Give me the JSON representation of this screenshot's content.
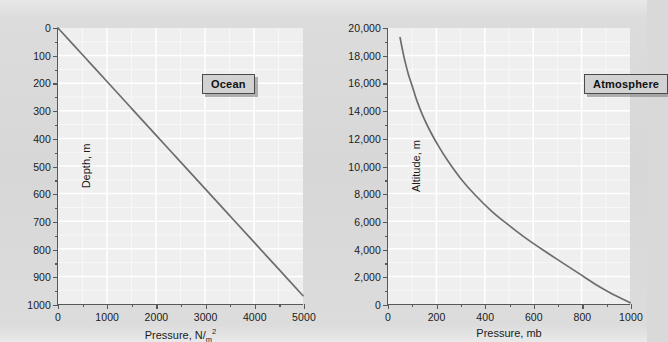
{
  "figure": {
    "background_color": "#d9d9d9",
    "plot_background_color": "#efefef",
    "gridline_color": "#ffffff",
    "axis_color": "#58585a",
    "curve_color": "#6d6d70"
  },
  "chart_data": [
    {
      "type": "line",
      "title": "Ocean",
      "xlabel": "Pressure, N/m²",
      "ylabel": "Depth, m",
      "xlim": [
        0,
        5000
      ],
      "ylim": [
        0,
        1000
      ],
      "y_inverted": true,
      "grid": true,
      "legend_position": "top-right",
      "xticks": [
        0,
        1000,
        2000,
        3000,
        4000,
        5000
      ],
      "xticklabels": [
        "0",
        "1000",
        "2000",
        "3000",
        "4000",
        "5000"
      ],
      "x_minor_tick_count": 1,
      "yticks": [
        0,
        100,
        200,
        300,
        400,
        500,
        600,
        700,
        800,
        900,
        1000
      ],
      "yticklabels": [
        "0",
        "100",
        "200",
        "300",
        "400",
        "500",
        "600",
        "700",
        "800",
        "900",
        "1000"
      ],
      "y_minor_tick_count": 1,
      "series": [
        {
          "name": "Ocean pressure vs depth",
          "x": [
            0,
            500,
            1000,
            1500,
            2000,
            2500,
            3000,
            3500,
            4000,
            4500,
            5000
          ],
          "y": [
            0,
            97,
            194,
            291,
            388,
            485,
            582,
            679,
            776,
            873,
            970
          ]
        }
      ]
    },
    {
      "type": "line",
      "title": "Atmosphere",
      "xlabel": "Pressure, mb",
      "ylabel": "Altitude, m",
      "xlim": [
        0,
        1000
      ],
      "ylim": [
        0,
        20000
      ],
      "y_inverted": false,
      "grid": true,
      "legend_position": "top-right",
      "xticks": [
        0,
        200,
        400,
        600,
        800,
        1000
      ],
      "xticklabels": [
        "0",
        "200",
        "400",
        "600",
        "800",
        "1000"
      ],
      "x_minor_tick_count": 1,
      "yticks": [
        0,
        2000,
        4000,
        6000,
        8000,
        10000,
        12000,
        14000,
        16000,
        18000,
        20000
      ],
      "yticklabels": [
        "0",
        "2,000",
        "4,000",
        "6,000",
        "8,000",
        "10,000",
        "12,000",
        "14,000",
        "16,000",
        "18,000",
        "20,000"
      ],
      "y_minor_tick_count": 1,
      "series": [
        {
          "name": "Atmospheric pressure vs altitude",
          "x": [
            50,
            60,
            70,
            85,
            100,
            120,
            145,
            175,
            210,
            250,
            300,
            360,
            430,
            500,
            575,
            650,
            720,
            790,
            860,
            925,
            1000
          ],
          "y": [
            19300,
            18400,
            17600,
            16600,
            15800,
            14700,
            13600,
            12500,
            11400,
            10300,
            9100,
            7900,
            6700,
            5700,
            4700,
            3800,
            3000,
            2200,
            1400,
            750,
            100
          ]
        }
      ]
    }
  ]
}
